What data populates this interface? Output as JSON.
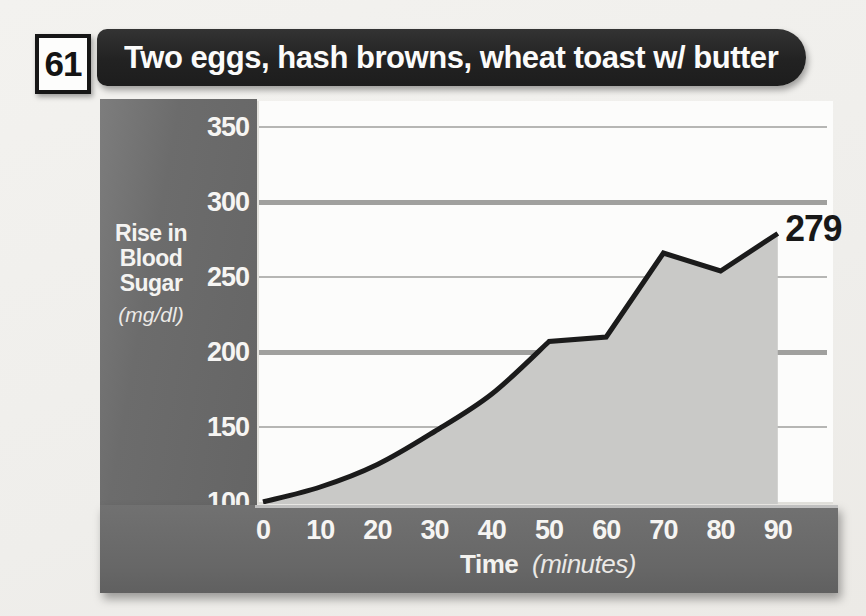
{
  "figure": {
    "number": "61",
    "title": "Two eggs, hash browns, wheat toast w/ butter"
  },
  "chart_data": {
    "type": "area",
    "title": "Two eggs, hash browns, wheat toast w/ butter",
    "x": [
      0,
      10,
      20,
      30,
      40,
      50,
      60,
      70,
      80,
      90
    ],
    "values": [
      100,
      110,
      125,
      147,
      172,
      207,
      210,
      266,
      254,
      279
    ],
    "peak_label": "279",
    "x_label": "Time",
    "x_units_label": "(minutes)",
    "y_label_lines": [
      "Rise in",
      "Blood",
      "Sugar"
    ],
    "y_units_label": "(mg/dl)",
    "y_ticks": [
      350,
      300,
      250,
      200,
      150,
      100
    ],
    "x_ticks": [
      0,
      10,
      20,
      30,
      40,
      50,
      60,
      70,
      80,
      90
    ],
    "xlim": [
      0,
      90
    ],
    "ylim": [
      100,
      350
    ],
    "grid": "horizontal only, alternating thin (350/250/150) and thick (300/200) lines",
    "legend": "none",
    "colors": {
      "line": "#1b1b1b",
      "area_fill": "#c9c9c7",
      "panel_gray": "#6c6c6c",
      "banner_black": "#232323",
      "plot_background": "#fcfcfb",
      "grid_thin": "#b6b6b4",
      "grid_thick": "#a0a09e",
      "text_light": "#f6f5f3"
    }
  }
}
